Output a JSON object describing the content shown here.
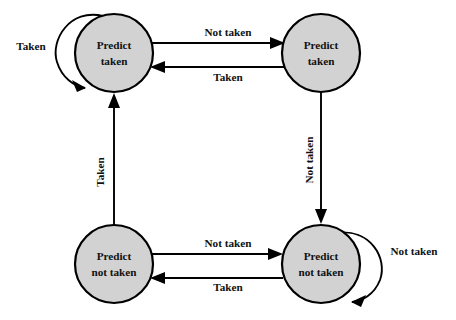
{
  "diagram": {
    "type": "state-machine",
    "colors": {
      "node_fill": "#d2d2d2",
      "node_stroke": "#000000",
      "edge": "#000000",
      "background": "#ffffff",
      "text": "#111111"
    },
    "states": [
      {
        "id": "predict-taken-strong",
        "line1": "Predict",
        "line2": "taken",
        "cx": 114,
        "cy": 53,
        "r": 39
      },
      {
        "id": "predict-taken-weak",
        "line1": "Predict",
        "line2": "taken",
        "cx": 321,
        "cy": 53,
        "r": 39
      },
      {
        "id": "predict-not-taken-weak",
        "line1": "Predict",
        "line2": "not taken",
        "cx": 114,
        "cy": 264,
        "r": 39
      },
      {
        "id": "predict-not-taken-strong",
        "line1": "Predict",
        "line2": "not taken",
        "cx": 321,
        "cy": 264,
        "r": 39
      }
    ],
    "transitions": [
      {
        "id": "self-loop-top-left",
        "label": "Taken",
        "from": "predict-taken-strong",
        "to": "predict-taken-strong",
        "kind": "self-loop",
        "label_x": 31,
        "label_y": 47,
        "rotated": false
      },
      {
        "id": "top-left-to-top-right",
        "label": "Not taken",
        "from": "predict-taken-strong",
        "to": "predict-taken-weak",
        "kind": "straight",
        "label_x": 228,
        "label_y": 33,
        "rotated": false
      },
      {
        "id": "top-right-to-top-left",
        "label": "Taken",
        "from": "predict-taken-weak",
        "to": "predict-taken-strong",
        "kind": "straight",
        "label_x": 228,
        "label_y": 78,
        "rotated": false
      },
      {
        "id": "top-right-to-bottom-right",
        "label": "Not taken",
        "from": "predict-taken-weak",
        "to": "predict-not-taken-strong",
        "kind": "straight",
        "label_x": 310,
        "label_y": 160,
        "rotated": true
      },
      {
        "id": "bottom-left-to-bottom-right",
        "label": "Not taken",
        "from": "predict-not-taken-weak",
        "to": "predict-not-taken-strong",
        "kind": "straight",
        "label_x": 228,
        "label_y": 244,
        "rotated": false
      },
      {
        "id": "bottom-right-to-bottom-left",
        "label": "Taken",
        "from": "predict-not-taken-strong",
        "to": "predict-not-taken-weak",
        "kind": "straight",
        "label_x": 228,
        "label_y": 288,
        "rotated": false
      },
      {
        "id": "self-loop-bottom-right",
        "label": "Not taken",
        "from": "predict-not-taken-strong",
        "to": "predict-not-taken-strong",
        "kind": "self-loop",
        "label_x": 414,
        "label_y": 252,
        "rotated": false
      },
      {
        "id": "bottom-left-to-top-left",
        "label": "Taken",
        "from": "predict-not-taken-weak",
        "to": "predict-taken-strong",
        "kind": "straight",
        "label_x": 101,
        "label_y": 172,
        "rotated": true
      }
    ]
  }
}
